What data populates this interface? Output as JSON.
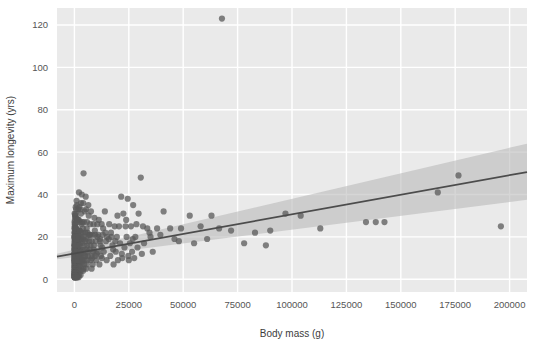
{
  "chart_data": {
    "type": "scatter",
    "title": "",
    "xlabel": "Body mass (g)",
    "ylabel": "Maximum longevity (yrs)",
    "xlim": [
      -8000,
      208000
    ],
    "ylim": [
      -6,
      128
    ],
    "xticks": [
      0,
      25000,
      50000,
      75000,
      100000,
      125000,
      150000,
      175000,
      200000
    ],
    "xticklabels": [
      "0",
      "25000",
      "50000",
      "75000",
      "100000",
      "125000",
      "150000",
      "175000",
      "200000"
    ],
    "yticks": [
      0,
      20,
      40,
      60,
      80,
      100,
      120
    ],
    "yticklabels": [
      "0",
      "20",
      "40",
      "60",
      "80",
      "100",
      "120"
    ],
    "grid": true,
    "grid_color": "#ffffff",
    "plot_background": "#eaeaea",
    "figure_background": "#ffffff",
    "legend": null,
    "point_color": "#595959",
    "point_opacity": 0.75,
    "point_radius": 3.1,
    "regression_line_color": "#4c4c4c",
    "confidence_band_color": "#b4b4b4",
    "confidence_band_opacity": 0.55,
    "regression": {
      "intercept": 12.2,
      "slope_per_unit": 0.00019,
      "y_at_xmin": 10.7,
      "y_at_xmax": 50.6,
      "band_lower_at_xmin": 9.4,
      "band_upper_at_xmin": 12.0,
      "band_lower_at_xmax": 37.5,
      "band_upper_at_xmax": 64.0
    },
    "points": [
      [
        67800,
        123
      ],
      [
        4200,
        50
      ],
      [
        30500,
        48
      ],
      [
        2100,
        41
      ],
      [
        3400,
        40
      ],
      [
        5200,
        39
      ],
      [
        21500,
        39
      ],
      [
        24500,
        38
      ],
      [
        1000,
        37
      ],
      [
        3000,
        36
      ],
      [
        6400,
        35
      ],
      [
        27000,
        35
      ],
      [
        176500,
        49
      ],
      [
        167000,
        41
      ],
      [
        600,
        34
      ],
      [
        1800,
        33
      ],
      [
        2600,
        33
      ],
      [
        4800,
        32
      ],
      [
        7600,
        32
      ],
      [
        14000,
        32
      ],
      [
        22500,
        31
      ],
      [
        29500,
        31
      ],
      [
        41000,
        32
      ],
      [
        53000,
        30
      ],
      [
        63000,
        30
      ],
      [
        97000,
        31
      ],
      [
        104000,
        30
      ],
      [
        196000,
        25
      ],
      [
        134000,
        27
      ],
      [
        138500,
        27
      ],
      [
        142500,
        27
      ],
      [
        300,
        30
      ],
      [
        500,
        29
      ],
      [
        900,
        29
      ],
      [
        1400,
        28
      ],
      [
        2000,
        28
      ],
      [
        2800,
        27
      ],
      [
        3600,
        27
      ],
      [
        4400,
        27
      ],
      [
        5800,
        27
      ],
      [
        7200,
        26
      ],
      [
        8800,
        26
      ],
      [
        10500,
        26
      ],
      [
        12500,
        26
      ],
      [
        16000,
        26
      ],
      [
        18500,
        25
      ],
      [
        20500,
        25
      ],
      [
        23500,
        25
      ],
      [
        26000,
        25
      ],
      [
        31500,
        25
      ],
      [
        33500,
        24
      ],
      [
        38000,
        24
      ],
      [
        44000,
        24
      ],
      [
        49000,
        24
      ],
      [
        58000,
        25
      ],
      [
        66500,
        24
      ],
      [
        72000,
        23
      ],
      [
        83000,
        22
      ],
      [
        90000,
        23
      ],
      [
        113000,
        24
      ],
      [
        150,
        25
      ],
      [
        250,
        24
      ],
      [
        400,
        24
      ],
      [
        700,
        24
      ],
      [
        1100,
        23
      ],
      [
        1600,
        23
      ],
      [
        2300,
        23
      ],
      [
        3100,
        22
      ],
      [
        3900,
        22
      ],
      [
        5000,
        22
      ],
      [
        6000,
        22
      ],
      [
        7000,
        21
      ],
      [
        8200,
        21
      ],
      [
        9500,
        21
      ],
      [
        11000,
        21
      ],
      [
        13000,
        21
      ],
      [
        15000,
        20
      ],
      [
        17000,
        20
      ],
      [
        19500,
        20
      ],
      [
        24000,
        20
      ],
      [
        28000,
        20
      ],
      [
        35000,
        20
      ],
      [
        46000,
        19
      ],
      [
        100,
        22
      ],
      [
        200,
        21
      ],
      [
        350,
        21
      ],
      [
        550,
        20
      ],
      [
        800,
        20
      ],
      [
        1200,
        20
      ],
      [
        1700,
        20
      ],
      [
        2400,
        19
      ],
      [
        3200,
        19
      ],
      [
        4100,
        19
      ],
      [
        5500,
        19
      ],
      [
        6800,
        18
      ],
      [
        8000,
        18
      ],
      [
        9800,
        18
      ],
      [
        11800,
        18
      ],
      [
        14500,
        18
      ],
      [
        21000,
        17
      ],
      [
        25500,
        17
      ],
      [
        32000,
        17
      ],
      [
        120,
        19
      ],
      [
        220,
        19
      ],
      [
        320,
        18
      ],
      [
        480,
        18
      ],
      [
        650,
        18
      ],
      [
        950,
        18
      ],
      [
        1300,
        17
      ],
      [
        1900,
        17
      ],
      [
        2700,
        17
      ],
      [
        3500,
        17
      ],
      [
        4600,
        16
      ],
      [
        5900,
        16
      ],
      [
        7400,
        16
      ],
      [
        9000,
        16
      ],
      [
        12000,
        16
      ],
      [
        17500,
        16
      ],
      [
        23000,
        15
      ],
      [
        29000,
        15
      ],
      [
        50,
        17
      ],
      [
        110,
        16
      ],
      [
        190,
        16
      ],
      [
        280,
        16
      ],
      [
        430,
        15
      ],
      [
        600,
        15
      ],
      [
        880,
        15
      ],
      [
        1250,
        15
      ],
      [
        1800,
        15
      ],
      [
        2500,
        14
      ],
      [
        3300,
        14
      ],
      [
        4300,
        14
      ],
      [
        5600,
        14
      ],
      [
        7100,
        14
      ],
      [
        8600,
        13
      ],
      [
        10800,
        13
      ],
      [
        13500,
        13
      ],
      [
        19000,
        13
      ],
      [
        26500,
        13
      ],
      [
        31000,
        12
      ],
      [
        40,
        14
      ],
      [
        90,
        14
      ],
      [
        160,
        14
      ],
      [
        240,
        13
      ],
      [
        380,
        13
      ],
      [
        520,
        13
      ],
      [
        760,
        13
      ],
      [
        1050,
        12
      ],
      [
        1550,
        12
      ],
      [
        2200,
        12
      ],
      [
        2900,
        12
      ],
      [
        3800,
        12
      ],
      [
        4900,
        11
      ],
      [
        6200,
        11
      ],
      [
        7800,
        11
      ],
      [
        9600,
        11
      ],
      [
        12200,
        11
      ],
      [
        16500,
        11
      ],
      [
        22000,
        10
      ],
      [
        27500,
        10
      ],
      [
        30,
        12
      ],
      [
        70,
        12
      ],
      [
        140,
        11
      ],
      [
        210,
        11
      ],
      [
        330,
        11
      ],
      [
        450,
        11
      ],
      [
        680,
        10
      ],
      [
        980,
        10
      ],
      [
        1400,
        10
      ],
      [
        2050,
        10
      ],
      [
        2750,
        10
      ],
      [
        3600,
        9
      ],
      [
        4700,
        9
      ],
      [
        6000,
        9
      ],
      [
        7500,
        9
      ],
      [
        10000,
        9
      ],
      [
        14800,
        9
      ],
      [
        20000,
        9
      ],
      [
        25000,
        9
      ],
      [
        20,
        10
      ],
      [
        60,
        10
      ],
      [
        120,
        9
      ],
      [
        180,
        9
      ],
      [
        290,
        9
      ],
      [
        410,
        9
      ],
      [
        620,
        8
      ],
      [
        870,
        8
      ],
      [
        1300,
        8
      ],
      [
        1850,
        8
      ],
      [
        2600,
        8
      ],
      [
        3400,
        8
      ],
      [
        4500,
        7
      ],
      [
        5700,
        7
      ],
      [
        8400,
        7
      ],
      [
        11500,
        7
      ],
      [
        18000,
        7
      ],
      [
        15,
        8
      ],
      [
        50,
        8
      ],
      [
        100,
        7
      ],
      [
        160,
        7
      ],
      [
        260,
        7
      ],
      [
        370,
        7
      ],
      [
        560,
        6
      ],
      [
        800,
        6
      ],
      [
        1150,
        6
      ],
      [
        1700,
        6
      ],
      [
        2350,
        6
      ],
      [
        3150,
        6
      ],
      [
        4200,
        5
      ],
      [
        5400,
        5
      ],
      [
        7900,
        5
      ],
      [
        10,
        6
      ],
      [
        45,
        6
      ],
      [
        85,
        5
      ],
      [
        145,
        5
      ],
      [
        230,
        5
      ],
      [
        340,
        5
      ],
      [
        500,
        5
      ],
      [
        720,
        4
      ],
      [
        1080,
        4
      ],
      [
        1600,
        4
      ],
      [
        2250,
        4
      ],
      [
        3000,
        4
      ],
      [
        4000,
        4
      ],
      [
        8,
        4
      ],
      [
        35,
        4
      ],
      [
        75,
        3
      ],
      [
        130,
        3
      ],
      [
        200,
        3
      ],
      [
        310,
        3
      ],
      [
        460,
        3
      ],
      [
        660,
        3
      ],
      [
        1000,
        3
      ],
      [
        1500,
        2
      ],
      [
        2100,
        2
      ],
      [
        2850,
        2
      ],
      [
        6,
        3
      ],
      [
        28,
        2
      ],
      [
        65,
        2
      ],
      [
        115,
        2
      ],
      [
        185,
        2
      ],
      [
        280,
        2
      ],
      [
        420,
        2
      ],
      [
        600,
        2
      ],
      [
        900,
        1
      ],
      [
        1350,
        1
      ],
      [
        1950,
        1
      ],
      [
        5,
        2
      ],
      [
        22,
        1
      ],
      [
        55,
        1
      ],
      [
        105,
        1
      ],
      [
        170,
        1
      ],
      [
        255,
        1
      ],
      [
        390,
        1
      ],
      [
        560,
        1
      ],
      [
        850,
        1
      ],
      [
        1250,
        1
      ],
      [
        18,
        16
      ],
      [
        42,
        20
      ],
      [
        95,
        22
      ],
      [
        175,
        26
      ],
      [
        240,
        28
      ],
      [
        360,
        30
      ],
      [
        540,
        31
      ],
      [
        780,
        33
      ],
      [
        1120,
        35
      ],
      [
        1650,
        28
      ],
      [
        2300,
        34
      ],
      [
        3050,
        31
      ],
      [
        4050,
        36
      ],
      [
        5300,
        33
      ],
      [
        6600,
        30
      ],
      [
        9200,
        29
      ],
      [
        11200,
        28
      ],
      [
        13200,
        24
      ],
      [
        16800,
        22
      ],
      [
        19800,
        30
      ],
      [
        23800,
        28
      ],
      [
        28500,
        26
      ],
      [
        34500,
        22
      ],
      [
        39500,
        21
      ],
      [
        12,
        12
      ],
      [
        38,
        15
      ],
      [
        80,
        18
      ],
      [
        150,
        12
      ],
      [
        225,
        15
      ],
      [
        345,
        19
      ],
      [
        510,
        22
      ],
      [
        740,
        16
      ],
      [
        1060,
        19
      ],
      [
        1580,
        22
      ],
      [
        2180,
        16
      ],
      [
        2950,
        20
      ],
      [
        3900,
        24
      ],
      [
        5150,
        18
      ],
      [
        6500,
        21
      ],
      [
        8900,
        14
      ],
      [
        10600,
        20
      ],
      [
        12800,
        15
      ],
      [
        15800,
        19
      ],
      [
        21800,
        12
      ],
      [
        26800,
        19
      ],
      [
        36000,
        13
      ],
      [
        9,
        9
      ],
      [
        32,
        11
      ],
      [
        72,
        13
      ],
      [
        135,
        9
      ],
      [
        205,
        10
      ],
      [
        315,
        12
      ],
      [
        470,
        9
      ],
      [
        690,
        11
      ],
      [
        1020,
        13
      ],
      [
        1480,
        9
      ],
      [
        2080,
        11
      ],
      [
        2820,
        13
      ],
      [
        3750,
        9
      ],
      [
        4850,
        11
      ],
      [
        6100,
        13
      ],
      [
        8200,
        10
      ],
      [
        10200,
        12
      ],
      [
        12600,
        10
      ],
      [
        17800,
        14
      ],
      [
        24800,
        11
      ],
      [
        7,
        20
      ],
      [
        26,
        24
      ],
      [
        58,
        27
      ],
      [
        112,
        31
      ],
      [
        168,
        20
      ],
      [
        255,
        23
      ],
      [
        395,
        26
      ],
      [
        575,
        20
      ],
      [
        830,
        24
      ],
      [
        1180,
        27
      ],
      [
        1720,
        20
      ],
      [
        2420,
        23
      ],
      [
        3280,
        26
      ],
      [
        4350,
        20
      ],
      [
        5650,
        24
      ],
      [
        7250,
        21
      ],
      [
        9400,
        23
      ],
      [
        11800,
        19
      ],
      [
        14200,
        22
      ],
      [
        18800,
        18
      ],
      [
        48000,
        18
      ],
      [
        55000,
        17
      ],
      [
        61000,
        19
      ],
      [
        78000,
        17
      ],
      [
        88000,
        16
      ]
    ]
  },
  "axis": {
    "xlabel": "Body mass (g)",
    "ylabel": "Maximum longevity (yrs)"
  }
}
